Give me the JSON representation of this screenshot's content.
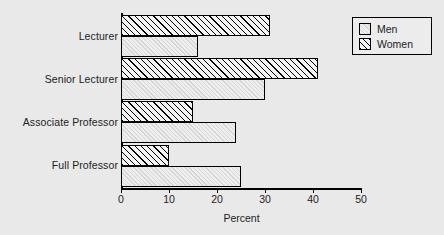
{
  "chart_data": {
    "type": "bar",
    "orientation": "horizontal",
    "title": "",
    "xlabel": "Percent",
    "ylabel": "",
    "xlim": [
      0,
      50
    ],
    "xticks": [
      0,
      10,
      20,
      30,
      40,
      50
    ],
    "xticklabels": [
      "0",
      "10",
      "20",
      "30",
      "40",
      "50"
    ],
    "categories": [
      "Lecturer",
      "Senior Lecturer",
      "Associate Professor",
      "Full Professor"
    ],
    "grid": false,
    "legend_position": "top-right",
    "series": [
      {
        "name": "Men",
        "style": "solid-light",
        "values": [
          16,
          30,
          24,
          25
        ]
      },
      {
        "name": "Women",
        "style": "diagonal-hatch",
        "values": [
          31,
          41,
          15,
          10
        ]
      }
    ]
  },
  "legend": {
    "entries": [
      {
        "label": "Men",
        "swatch": "solid-swatch-icon"
      },
      {
        "label": "Women",
        "swatch": "hatch-swatch-icon"
      }
    ]
  },
  "axis": {
    "x_title": "Percent",
    "tick_labels": [
      "0",
      "10",
      "20",
      "30",
      "40",
      "50"
    ]
  },
  "categories": [
    "Lecturer",
    "Senior Lecturer",
    "Associate Professor",
    "Full Professor"
  ]
}
